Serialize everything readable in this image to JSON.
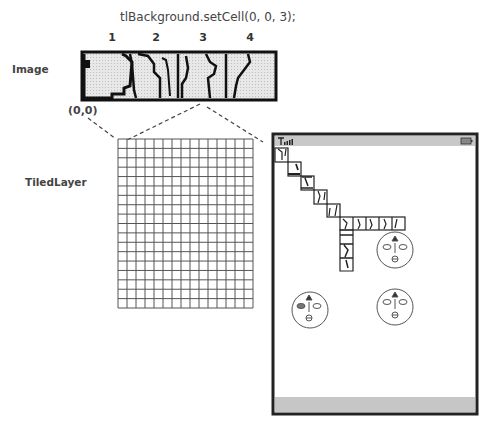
{
  "title": "tlBackground.setCell(0, 0, 3);",
  "tile_numbers": [
    "1",
    "2",
    "3",
    "4"
  ],
  "labels": {
    "image": "Image",
    "origin": "(0,0)",
    "tiled_layer": "TiledLayer"
  },
  "grid": {
    "columns": 15,
    "rows": 18
  },
  "phone": {
    "status_icons": [
      "signal-icon",
      "battery-icon"
    ],
    "faces": [
      {
        "name": "face-top-right",
        "left_eye": "open",
        "right_eye": "open"
      },
      {
        "name": "face-bottom-left",
        "left_eye": "filled",
        "right_eye": "open"
      },
      {
        "name": "face-bottom-right",
        "left_eye": "open",
        "right_eye": "open"
      }
    ]
  },
  "colors": {
    "tile_fill": "#e4e4e4",
    "tile_border": "#111111",
    "status_bar": "#c8c8c8",
    "soft_bar": "#c6c6c6",
    "frame": "#222222"
  }
}
